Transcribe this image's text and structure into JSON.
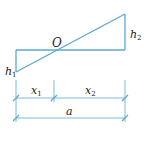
{
  "diagram": {
    "colors": {
      "line": "#5aa9cf",
      "text": "#222222"
    },
    "labels": {
      "origin": "O",
      "h1_main": "h",
      "h1_sub": "1",
      "h2_main": "h",
      "h2_sub": "2",
      "x1_main": "x",
      "x1_sub": "1",
      "x2_main": "x",
      "x2_sub": "2",
      "a": "a"
    }
  }
}
